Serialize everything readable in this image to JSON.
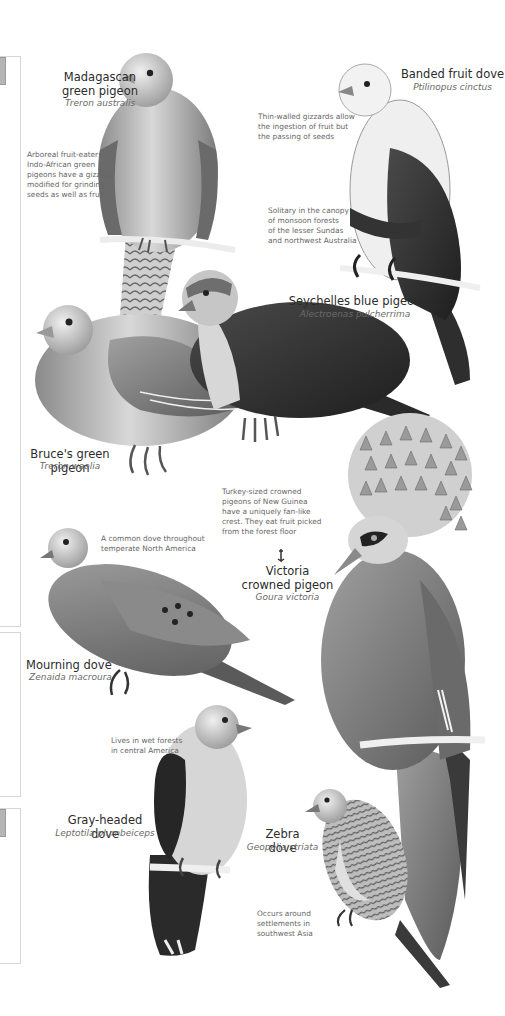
{
  "plate": {
    "side_panels": [
      {
        "top": 56,
        "height": 569,
        "has_tab": true
      },
      {
        "top": 632,
        "height": 163,
        "has_tab": false
      },
      {
        "top": 808,
        "height": 154,
        "has_tab": true
      }
    ],
    "species": [
      {
        "id": "madagascan",
        "name_line1": "Madagascan",
        "name_line2": "green pigeon",
        "scientific": "Treron australis",
        "note": [
          "Arboreal fruit-eaters,",
          "Indo-African green",
          "pigeons have a gizzard",
          "modified for grinding",
          "seeds as well as fruit"
        ]
      },
      {
        "id": "banded",
        "name": "Banded fruit dove",
        "scientific": "Ptilinopus cinctus",
        "note": [
          "Thin-walled gizzards allow",
          "the ingestion of fruit but",
          "the passing of seeds"
        ],
        "note2": [
          "Solitary in the canopy",
          "of monsoon forests",
          "of the lesser Sundas",
          "and northwest Australia"
        ]
      },
      {
        "id": "seychelles",
        "name": "Seychelles blue pigeon",
        "scientific": "Alectroenas pulcherrima"
      },
      {
        "id": "bruces",
        "name": "Bruce's green pigeon",
        "scientific": "Treron waalia"
      },
      {
        "id": "victoria",
        "name_line1": "Victoria",
        "name_line2": "crowned pigeon",
        "scientific": "Goura victoria",
        "note": [
          "Turkey-sized crowned",
          "pigeons of New Guinea",
          "have a uniquely fan-like",
          "crest. They eat fruit picked",
          "from the forest floor"
        ]
      },
      {
        "id": "mourning",
        "name": "Mourning dove",
        "scientific": "Zenaida macroura",
        "note": [
          "A common dove throughout",
          "temperate North America"
        ]
      },
      {
        "id": "grayheaded",
        "name": "Gray-headed dove",
        "scientific": "Leptotila plumbeiceps",
        "note": [
          "Lives in wet forests",
          "in central America"
        ]
      },
      {
        "id": "zebra",
        "name": "Zebra dove",
        "scientific": "Geopelia striata",
        "note": [
          "Occurs around",
          "settlements in",
          "southwest Asia"
        ]
      }
    ],
    "colors": {
      "ink": "#2b2b2b",
      "muted": "#6a6a6a",
      "panel_border": "#d6d6d6"
    }
  }
}
